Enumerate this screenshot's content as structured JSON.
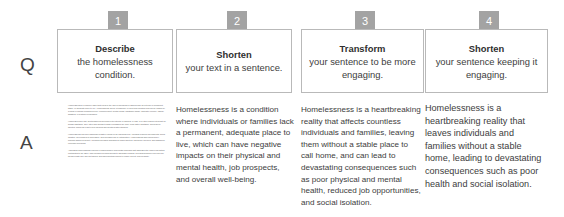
{
  "meta": {
    "badge_color": "#a3a3a3",
    "card_border_color": "#b9b9b9",
    "text_color": "#3d3d3d",
    "background": "#ffffff"
  },
  "row_labels": {
    "question": "Q",
    "answer": "A"
  },
  "columns": [
    {
      "step_number": "1",
      "question": {
        "verb": "Describe",
        "rest": "the homelessness condition."
      },
      "answer_paragraphs": [
        "Homelessness is a complex issue that refers to the lack of individuals or families who do not have a permanent, stable, or adequate place to live. Homelessness can be a temporary or long-term condition and can be caused by a range of factors including poverty, unemployment, mental health, substance abuse, domestic violence, natural disasters, or systemic inequalities.",
        "Homeless people may find themselves sleeping on the streets, in shelters, in cars, or in other places not meant for human habitation. They often lack access to basic necessities like food, clean water, sanitation, and hygiene facilities, which can lead to poor physical and mental health outcomes.",
        "Homelessness can have significant negative effects on an individual's life, including reduced job prospects, social isolation, development of depression, and increased risk of victimization. Homelessness also places heavy financial strains on society, including increased demands for public shelters, emergency services, and subsidized economic provisions.",
        "Addressing homelessness requires a comprehensive and holistic approach that addresses the underlying factors contributing to the issue. This includes providing access to affordable housing, providing supportive services like mental health care and job training, and implementing policies to reduce poverty and inequality."
      ]
    },
    {
      "step_number": "2",
      "question": {
        "verb": "Shorten",
        "rest": "your text in a sentence."
      },
      "answer": "Homelessness is a condition where individuals or families lack a permanent, adequate place to live, which can have negative impacts on their physical and mental health, job prospects, and overall well-being."
    },
    {
      "step_number": "3",
      "question": {
        "verb": "Transform",
        "rest": "your sentence to be more engaging."
      },
      "answer": "Homelessness is a heartbreaking reality that affects countless individuals and families, leaving them without a stable place to call home, and can lead to devastating consequences such as poor physical and mental health, reduced job opportunities, and social isolation."
    },
    {
      "step_number": "4",
      "question": {
        "verb": "Shorten",
        "rest": "your sentence keeping it engaging."
      },
      "answer": "Homelessness is a heartbreaking reality that leaves individuals and families without a stable home, leading to devastating consequences such as poor health and social isolation."
    }
  ]
}
